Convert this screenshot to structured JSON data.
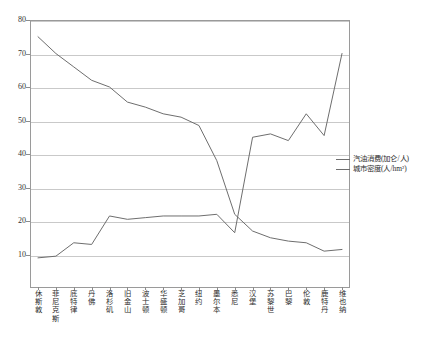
{
  "chart_data": {
    "type": "line",
    "title": "",
    "subtitle": "",
    "xlabel": "",
    "ylabel": "",
    "ylim": [
      0,
      80
    ],
    "yticks": [
      10,
      20,
      30,
      40,
      50,
      60,
      70,
      80
    ],
    "grid": true,
    "legend_position": "right-middle",
    "categories": [
      "休斯敦",
      "菲尼克斯",
      "底特律",
      "丹佛",
      "洛杉矶",
      "旧金山",
      "波士顿",
      "华盛顿",
      "芝加哥",
      "纽约",
      "墨尔本",
      "悉尼",
      "汉堡",
      "苏黎世",
      "巴黎",
      "伦敦",
      "鹿特丹",
      "维也纳"
    ],
    "series": [
      {
        "name": "汽油消费(加仑/人)",
        "name_base": "汽油消费(加仑/人)",
        "color": "#6e6e6e",
        "values": [
          75,
          70,
          66,
          62,
          60,
          55.5,
          54,
          52,
          51,
          48.5,
          38,
          22,
          17,
          15,
          14,
          13.5,
          11,
          11.5
        ]
      },
      {
        "name": "城市密度(人/hm²)",
        "name_base": "城市密度(人/hm",
        "name_sup": "2",
        "name_tail": ")",
        "color": "#6e6e6e",
        "values": [
          9,
          9.5,
          13.5,
          13,
          21.5,
          20.5,
          21,
          21.5,
          21.5,
          21.5,
          22,
          16.5,
          45,
          46,
          44,
          52,
          45.5,
          70
        ]
      }
    ]
  },
  "legend": {
    "items": [
      {
        "label": "汽油消费(加仑/人)"
      },
      {
        "label": "城市密度(人/hm²)"
      }
    ]
  }
}
